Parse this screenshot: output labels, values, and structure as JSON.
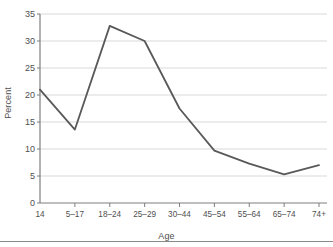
{
  "chart_data": {
    "type": "line",
    "title": "",
    "xlabel": "Age",
    "ylabel": "Percent",
    "categories": [
      "14",
      "5–17",
      "18–24",
      "25–29",
      "30–44",
      "45–54",
      "55–64",
      "65–74",
      "74+"
    ],
    "values": [
      21.0,
      13.6,
      32.8,
      30.0,
      17.5,
      9.7,
      7.3,
      5.3,
      7.0
    ],
    "series": [
      {
        "name": "Percent",
        "values": [
          21.0,
          13.6,
          32.8,
          30.0,
          17.5,
          9.7,
          7.3,
          5.3,
          7.0
        ]
      }
    ],
    "ylim": [
      0,
      35
    ],
    "yticks": [
      0,
      5,
      10,
      15,
      20,
      25,
      30,
      35
    ],
    "ytick_labels": [
      "0",
      "5",
      "10",
      "15",
      "20",
      "25",
      "30",
      "35"
    ],
    "grid": "horizontal",
    "legend": "none",
    "line_color": "#595959",
    "grid_color": "#d9d9d9",
    "axis_color": "#7f7f7f"
  },
  "axes": {
    "x_title": "Age",
    "y_title": "Percent"
  }
}
